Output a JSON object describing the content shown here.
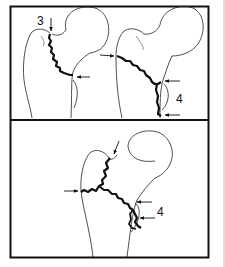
{
  "figure": {
    "panels": [
      {
        "id": "top-left",
        "labels": [
          {
            "text": "3"
          }
        ],
        "arrows": 2
      },
      {
        "id": "top-right",
        "labels": [
          {
            "text": "4"
          }
        ],
        "arrows": 3
      },
      {
        "id": "bottom",
        "labels": [
          {
            "text": "4"
          }
        ],
        "arrows": 4
      }
    ]
  },
  "colors": {
    "ink": "#111111",
    "frame": "#111111",
    "background": "#ffffff",
    "edge_line": "#bbbbbb"
  }
}
